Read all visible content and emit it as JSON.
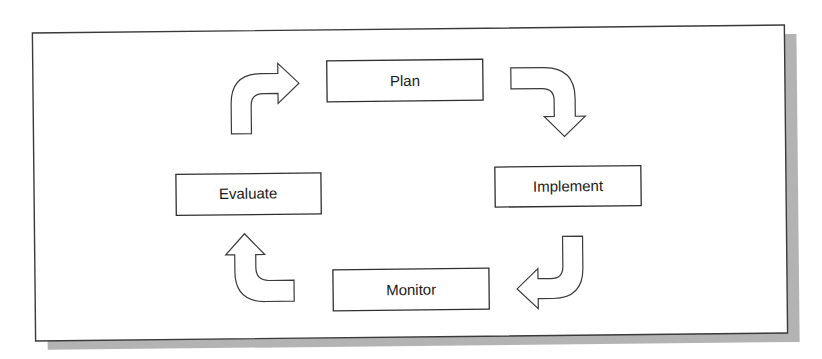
{
  "diagram": {
    "type": "cycle",
    "colors": {
      "background": "#ffffff",
      "frame_border": "#3a3a3a",
      "frame_shadow": "#b3b3b3",
      "box_border": "#2f2f2f",
      "text": "#1a1a1a"
    },
    "steps": [
      {
        "id": "plan",
        "label": "Plan"
      },
      {
        "id": "implement",
        "label": "Implement"
      },
      {
        "id": "monitor",
        "label": "Monitor"
      },
      {
        "id": "evaluate",
        "label": "Evaluate"
      }
    ],
    "arrows": [
      {
        "from": "evaluate",
        "to": "plan",
        "icon": "curved-arrow-up-right"
      },
      {
        "from": "plan",
        "to": "implement",
        "icon": "curved-arrow-right-down"
      },
      {
        "from": "implement",
        "to": "monitor",
        "icon": "curved-arrow-down-left"
      },
      {
        "from": "monitor",
        "to": "evaluate",
        "icon": "curved-arrow-left-up"
      }
    ]
  }
}
